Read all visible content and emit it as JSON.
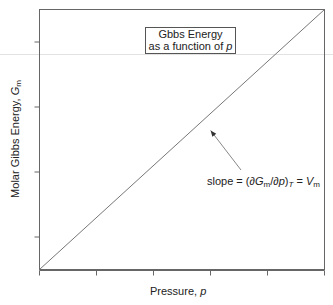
{
  "chart_data": {
    "type": "line",
    "title": "",
    "xlabel": "Pressure, p",
    "ylabel": "Molar Gibbs Energy, G_m",
    "xlim": [
      0,
      5
    ],
    "ylim": [
      0,
      4
    ],
    "x_ticks": [
      0,
      1,
      2,
      3,
      4,
      5
    ],
    "y_ticks": [
      0.5,
      1.5,
      2.5,
      3.5
    ],
    "tick_labels_shown": false,
    "grid": false,
    "series": [
      {
        "name": "G_m vs p",
        "x": [
          0,
          5
        ],
        "y": [
          0,
          4
        ]
      }
    ],
    "annotations": [
      {
        "type": "box",
        "lines": [
          "Gbbs Energy",
          "as a function of p"
        ]
      },
      {
        "type": "arrow-label",
        "text": "slope = (∂G_m/∂p)_T = V_m",
        "points_to": [
          2.95,
          2.2
        ]
      }
    ]
  },
  "labels": {
    "box_line1": "Gbbs Energy",
    "box_line2_prefix": "as a function of ",
    "box_line2_var": "p",
    "x_prefix": "Pressure, ",
    "x_var": "p",
    "y_prefix": "Molar Gibbs Energy, ",
    "y_var": "G",
    "y_sub": "m",
    "slope_prefix": "slope = (∂",
    "slope_G": "G",
    "slope_m1": "m",
    "slope_mid": "/∂",
    "slope_p": "p",
    "slope_close": ")",
    "slope_T": "T",
    "slope_eq": " = ",
    "slope_V": "V",
    "slope_m2": "m"
  },
  "colors": {
    "axis": "#555555",
    "line": "#777777",
    "arrow": "#888888"
  }
}
